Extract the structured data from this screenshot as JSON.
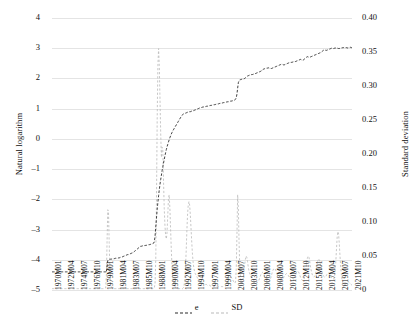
{
  "chart_data": {
    "type": "line",
    "title": "",
    "xlabel": "",
    "ylabel": "Natural logarithm",
    "y2label": "Standard deviation",
    "grid": true,
    "legend_position": "bottom-center",
    "ylim": [
      -5,
      4
    ],
    "y2lim": [
      0,
      0.4
    ],
    "yticks": [
      "4",
      "3",
      "2",
      "1",
      "0",
      "–1",
      "–2",
      "–3",
      "–4",
      "–5"
    ],
    "ytick_values": [
      4,
      3,
      2,
      1,
      0,
      -1,
      -2,
      -3,
      -4,
      -5
    ],
    "y2ticks": [
      "0.40",
      "0.35",
      "0.30",
      "0.25",
      "0.20",
      "0.15",
      "0.10",
      "0.05",
      "0"
    ],
    "y2tick_values": [
      0.4,
      0.35,
      0.3,
      0.25,
      0.2,
      0.15,
      0.1,
      0.05,
      0
    ],
    "xtick_labels": [
      "1970M01",
      "1972M04",
      "1974M07",
      "1976M10",
      "1979M01",
      "1981M04",
      "1983M07",
      "1985M10",
      "1988M01",
      "1990M04",
      "1992M07",
      "1994M10",
      "1997M01",
      "1999M04",
      "2001M07",
      "2003M10",
      "2006M01",
      "2008M04",
      "2010M07",
      "2012M10",
      "2015M01",
      "2017M04",
      "2019M07",
      "2021M10"
    ],
    "colors": {
      "e": "#2b2b2b",
      "SD": "#b9b9b9",
      "grid": "#e4e4e4"
    },
    "series": [
      {
        "name": "e",
        "axis": "left",
        "style": "dashed",
        "color": "#2b2b2b",
        "values": [
          -4.4,
          -4.4,
          -4.4,
          -4.4,
          -4.4,
          -4.4,
          -4.4,
          -4.4,
          -4.4,
          -4.4,
          -4.4,
          -4.4,
          -4.4,
          -4.4,
          -4.4,
          -4.4,
          -4.4,
          -4.4,
          -4.4,
          -4.4,
          -4.4,
          -4.4,
          -4.4,
          -4.4,
          -4.4,
          -4.4,
          -4.4,
          -4.4,
          -4.4,
          -4.4,
          -4.4,
          -4.4,
          -4.4,
          -4.4,
          -4.4,
          -4.4,
          -4.4,
          -4.4,
          -4.4,
          -4.4,
          -4.4,
          -4.4,
          -4.4,
          -4.4,
          -4.4,
          -4.4,
          -4.4,
          -4.4,
          -4.4,
          -4.4,
          -4.4,
          -4.4,
          -4.4,
          -4.4,
          -4.4,
          -4.4,
          -4.4,
          -4.4,
          -4.4,
          -4.4,
          -4.4,
          -4.4,
          -4.4,
          -4.4,
          -4.4,
          -4.4,
          -4.4,
          -4.4,
          -4.4,
          -4.4,
          -4.4,
          -4.4,
          -4.4,
          -4.4,
          -4.4,
          -4.4,
          -4.4,
          -4.42,
          -4.2,
          -4.03,
          -4.0,
          -3.99,
          -3.99,
          -3.98,
          -3.98,
          -3.97,
          -3.97,
          -3.97,
          -3.96,
          -3.96,
          -3.95,
          -3.95,
          -3.95,
          -3.95,
          -3.94,
          -3.94,
          -3.93,
          -3.92,
          -3.92,
          -3.91,
          -3.9,
          -3.89,
          -3.88,
          -3.87,
          -3.86,
          -3.85,
          -3.84,
          -3.83,
          -3.83,
          -3.82,
          -3.81,
          -3.8,
          -3.79,
          -3.78,
          -3.77,
          -3.76,
          -3.74,
          -3.72,
          -3.7,
          -3.68,
          -3.66,
          -3.64,
          -3.62,
          -3.6,
          -3.58,
          -3.56,
          -3.55,
          -3.55,
          -3.54,
          -3.54,
          -3.54,
          -3.53,
          -3.53,
          -3.52,
          -3.52,
          -3.51,
          -3.51,
          -3.5,
          -3.5,
          -3.49,
          -3.49,
          -3.48,
          -3.47,
          -3.46,
          -3.45,
          -3.4,
          -3.22,
          -2.92,
          -2.62,
          -2.34,
          -2.1,
          -1.88,
          -1.68,
          -1.5,
          -1.34,
          -1.2,
          -1.05,
          -0.92,
          -0.8,
          -0.68,
          -0.56,
          -0.45,
          -0.35,
          -0.26,
          -0.18,
          -0.1,
          -0.03,
          0.04,
          0.1,
          0.16,
          0.21,
          0.26,
          0.3,
          0.34,
          0.38,
          0.42,
          0.46,
          0.5,
          0.54,
          0.58,
          0.62,
          0.66,
          0.7,
          0.74,
          0.78,
          0.8,
          0.82,
          0.83,
          0.84,
          0.85,
          0.86,
          0.87,
          0.88,
          0.88,
          0.89,
          0.9,
          0.9,
          0.91,
          0.92,
          0.92,
          0.93,
          0.94,
          0.95,
          0.96,
          0.97,
          0.98,
          0.99,
          1.0,
          1.01,
          1.02,
          1.03,
          1.04,
          1.04,
          1.05,
          1.05,
          1.06,
          1.06,
          1.07,
          1.07,
          1.08,
          1.08,
          1.09,
          1.09,
          1.1,
          1.1,
          1.11,
          1.11,
          1.12,
          1.12,
          1.13,
          1.13,
          1.14,
          1.14,
          1.15,
          1.15,
          1.16,
          1.16,
          1.17,
          1.17,
          1.18,
          1.18,
          1.19,
          1.19,
          1.2,
          1.2,
          1.21,
          1.21,
          1.22,
          1.22,
          1.23,
          1.23,
          1.24,
          1.24,
          1.25,
          1.25,
          1.26,
          1.26,
          1.27,
          1.28,
          1.29,
          1.31,
          1.36,
          1.48,
          1.68,
          1.86,
          1.92,
          1.95,
          1.96,
          1.97,
          1.97,
          1.98,
          1.98,
          1.99,
          2.0,
          2.02,
          2.04,
          2.06,
          2.08,
          2.09,
          2.1,
          2.11,
          2.12,
          2.12,
          2.13,
          2.13,
          2.14,
          2.14,
          2.15,
          2.16,
          2.17,
          2.18,
          2.19,
          2.2,
          2.21,
          2.22,
          2.23,
          2.24,
          2.26,
          2.28,
          2.3,
          2.31,
          2.32,
          2.33,
          2.33,
          2.34,
          2.34,
          2.35,
          2.35,
          2.34,
          2.34,
          2.33,
          2.33,
          2.34,
          2.35,
          2.36,
          2.37,
          2.38,
          2.39,
          2.4,
          2.41,
          2.42,
          2.43,
          2.44,
          2.45,
          2.46,
          2.47,
          2.47,
          2.46,
          2.45,
          2.45,
          2.46,
          2.47,
          2.48,
          2.49,
          2.5,
          2.51,
          2.52,
          2.52,
          2.53,
          2.53,
          2.54,
          2.54,
          2.55,
          2.55,
          2.56,
          2.56,
          2.57,
          2.58,
          2.59,
          2.6,
          2.61,
          2.62,
          2.63,
          2.62,
          2.61,
          2.6,
          2.61,
          2.63,
          2.65,
          2.67,
          2.69,
          2.71,
          2.72,
          2.71,
          2.7,
          2.7,
          2.71,
          2.72,
          2.73,
          2.74,
          2.75,
          2.76,
          2.77,
          2.78,
          2.79,
          2.8,
          2.81,
          2.82,
          2.83,
          2.84,
          2.85,
          2.86,
          2.88,
          2.9,
          2.92,
          2.94,
          2.95,
          2.94,
          2.93,
          2.93,
          2.94,
          2.95,
          2.96,
          2.97,
          2.98,
          2.99,
          3.0,
          3.0,
          2.99,
          2.99,
          3.0,
          3.0,
          3.01,
          3.01,
          3.0,
          3.0,
          2.99,
          2.99,
          3.0,
          3.0,
          3.01,
          3.01,
          3.02,
          3.02,
          3.03,
          3.03,
          3.02,
          3.02,
          3.01,
          3.01,
          3.02,
          3.02,
          3.03,
          3.03,
          3.02,
          3.02
        ]
      },
      {
        "name": "SD",
        "axis": "right",
        "style": "dashed",
        "color": "#b9b9b9",
        "values": [
          0.002,
          0.002,
          0.002,
          0.002,
          0.002,
          0.002,
          0.002,
          0.002,
          0.002,
          0.002,
          0.002,
          0.002,
          0.002,
          0.002,
          0.002,
          0.002,
          0.002,
          0.002,
          0.002,
          0.002,
          0.002,
          0.002,
          0.002,
          0.002,
          0.002,
          0.002,
          0.002,
          0.002,
          0.002,
          0.002,
          0.002,
          0.002,
          0.002,
          0.002,
          0.002,
          0.002,
          0.002,
          0.002,
          0.002,
          0.002,
          0.002,
          0.002,
          0.002,
          0.002,
          0.002,
          0.002,
          0.002,
          0.002,
          0.002,
          0.002,
          0.002,
          0.002,
          0.002,
          0.002,
          0.002,
          0.002,
          0.002,
          0.002,
          0.002,
          0.002,
          0.002,
          0.002,
          0.002,
          0.002,
          0.002,
          0.002,
          0.002,
          0.002,
          0.002,
          0.002,
          0.002,
          0.002,
          0.002,
          0.002,
          0.002,
          0.002,
          0.003,
          0.02,
          0.07,
          0.118,
          0.116,
          0.07,
          0.028,
          0.01,
          0.005,
          0.003,
          0.002,
          0.002,
          0.002,
          0.002,
          0.002,
          0.002,
          0.002,
          0.002,
          0.002,
          0.002,
          0.002,
          0.002,
          0.002,
          0.002,
          0.002,
          0.002,
          0.002,
          0.002,
          0.002,
          0.002,
          0.002,
          0.002,
          0.002,
          0.002,
          0.002,
          0.002,
          0.002,
          0.002,
          0.002,
          0.002,
          0.002,
          0.002,
          0.002,
          0.002,
          0.002,
          0.002,
          0.002,
          0.002,
          0.002,
          0.002,
          0.002,
          0.002,
          0.002,
          0.002,
          0.002,
          0.002,
          0.002,
          0.002,
          0.002,
          0.002,
          0.002,
          0.002,
          0.002,
          0.002,
          0.002,
          0.002,
          0.002,
          0.002,
          0.002,
          0.003,
          0.01,
          0.045,
          0.13,
          0.25,
          0.33,
          0.355,
          0.33,
          0.28,
          0.23,
          0.195,
          0.21,
          0.205,
          0.16,
          0.12,
          0.095,
          0.08,
          0.075,
          0.085,
          0.11,
          0.135,
          0.14,
          0.12,
          0.09,
          0.06,
          0.035,
          0.02,
          0.012,
          0.008,
          0.005,
          0.004,
          0.003,
          0.003,
          0.002,
          0.002,
          0.002,
          0.002,
          0.002,
          0.002,
          0.002,
          0.002,
          0.003,
          0.006,
          0.014,
          0.03,
          0.055,
          0.085,
          0.11,
          0.125,
          0.13,
          0.125,
          0.11,
          0.09,
          0.07,
          0.052,
          0.04,
          0.032,
          0.027,
          0.024,
          0.022,
          0.02,
          0.018,
          0.016,
          0.015,
          0.014,
          0.013,
          0.012,
          0.011,
          0.01,
          0.01,
          0.009,
          0.009,
          0.008,
          0.008,
          0.008,
          0.007,
          0.007,
          0.007,
          0.007,
          0.006,
          0.006,
          0.006,
          0.006,
          0.006,
          0.005,
          0.005,
          0.005,
          0.005,
          0.005,
          0.005,
          0.005,
          0.005,
          0.005,
          0.005,
          0.005,
          0.005,
          0.005,
          0.005,
          0.005,
          0.005,
          0.005,
          0.006,
          0.008,
          0.011,
          0.014,
          0.017,
          0.019,
          0.02,
          0.02,
          0.019,
          0.017,
          0.015,
          0.013,
          0.011,
          0.01,
          0.012,
          0.03,
          0.08,
          0.14,
          0.12,
          0.07,
          0.035,
          0.018,
          0.012,
          0.01,
          0.012,
          0.018,
          0.028,
          0.038,
          0.045,
          0.05,
          0.048,
          0.042,
          0.034,
          0.028,
          0.024,
          0.022,
          0.02,
          0.018,
          0.016,
          0.015,
          0.014,
          0.013,
          0.012,
          0.012,
          0.011,
          0.011,
          0.012,
          0.014,
          0.017,
          0.02,
          0.023,
          0.025,
          0.026,
          0.025,
          0.023,
          0.02,
          0.018,
          0.016,
          0.014,
          0.013,
          0.012,
          0.012,
          0.013,
          0.015,
          0.018,
          0.022,
          0.026,
          0.029,
          0.031,
          0.032,
          0.031,
          0.029,
          0.026,
          0.023,
          0.02,
          0.018,
          0.016,
          0.015,
          0.014,
          0.014,
          0.015,
          0.016,
          0.018,
          0.02,
          0.022,
          0.023,
          0.024,
          0.024,
          0.023,
          0.021,
          0.019,
          0.017,
          0.015,
          0.014,
          0.013,
          0.013,
          0.014,
          0.016,
          0.019,
          0.022,
          0.025,
          0.027,
          0.028,
          0.027,
          0.025,
          0.022,
          0.019,
          0.017,
          0.015,
          0.014,
          0.014,
          0.016,
          0.02,
          0.026,
          0.034,
          0.042,
          0.048,
          0.05,
          0.048,
          0.043,
          0.036,
          0.03,
          0.025,
          0.022,
          0.02,
          0.019,
          0.02,
          0.023,
          0.028,
          0.034,
          0.04,
          0.044,
          0.046,
          0.044,
          0.04,
          0.034,
          0.029,
          0.025,
          0.022,
          0.02,
          0.019,
          0.019,
          0.02,
          0.022,
          0.024,
          0.025,
          0.025,
          0.024,
          0.022,
          0.02,
          0.018,
          0.017,
          0.016,
          0.016,
          0.018,
          0.025,
          0.04,
          0.06,
          0.078,
          0.086,
          0.082,
          0.068,
          0.05,
          0.034,
          0.022,
          0.015,
          0.011,
          0.009,
          0.008,
          0.008,
          0.009,
          0.01,
          0.011,
          0.012,
          0.012,
          0.011,
          0.01,
          0.009,
          0.008,
          0.007
        ]
      }
    ]
  },
  "legend": {
    "items": [
      {
        "label": "e",
        "color": "#2b2b2b"
      },
      {
        "label": "SD",
        "color": "#b9b9b9"
      }
    ]
  }
}
